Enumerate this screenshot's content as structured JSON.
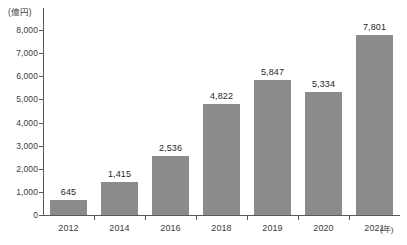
{
  "chart_data": {
    "type": "bar",
    "title": "",
    "subtitle": "",
    "xlabel": "(年)",
    "ylabel": "(億円)",
    "categories": [
      "2012",
      "2014",
      "2016",
      "2018",
      "2019",
      "2020",
      "2021"
    ],
    "values": [
      645,
      1415,
      2536,
      4822,
      5847,
      5334,
      7801
    ],
    "value_labels": [
      "645",
      "1,415",
      "2,536",
      "4,822",
      "5,847",
      "5,334",
      "7,801"
    ],
    "ylim": [
      0,
      8000
    ],
    "ytick_values": [
      0,
      1000,
      2000,
      3000,
      4000,
      5000,
      6000,
      7000,
      8000
    ],
    "ytick_labels": [
      "0",
      "1,000",
      "2,000",
      "3,000",
      "4,000",
      "5,000",
      "6,000",
      "7,000",
      "8,000"
    ],
    "grid": false,
    "legend": null,
    "legend_position": "none",
    "series": [
      {
        "name": "",
        "values": [
          645,
          1415,
          2536,
          4822,
          5847,
          5334,
          7801
        ]
      }
    ],
    "colors": {
      "bar": "#8b8b8b",
      "axis": "#5a5a5a",
      "text": "#1f1f1f",
      "tick_text": "#3b3b3b",
      "background": "#ffffff"
    }
  }
}
